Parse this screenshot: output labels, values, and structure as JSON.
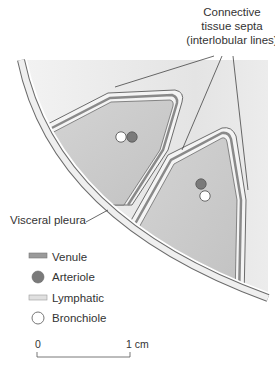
{
  "title_label": {
    "lines": [
      "Connective",
      "tissue septa",
      "(interlobular lines)"
    ]
  },
  "pleura_label": "Visceral pleura",
  "legend": {
    "items": [
      {
        "key": "venule",
        "label": "Venule",
        "symbol": "double-line-dark"
      },
      {
        "key": "arteriole",
        "label": "Arteriole",
        "symbol": "filled-circle"
      },
      {
        "key": "lymphatic",
        "label": "Lymphatic",
        "symbol": "double-line-light"
      },
      {
        "key": "bronchiole",
        "label": "Bronchiole",
        "symbol": "open-circle"
      }
    ]
  },
  "scale_bar": {
    "start_label": "0",
    "end_label": "1 cm"
  },
  "colors": {
    "background_region": "#e6e6e6",
    "lobule_fill": "#c9c9c9",
    "pleura_fill": "#efefef",
    "outline": "#6b6b6b",
    "venule": "#8a8a8a",
    "arteriole": "#7a7a7a",
    "lymphatic": "#dcdcdc",
    "bronchiole": "#ffffff",
    "text": "#333333"
  }
}
